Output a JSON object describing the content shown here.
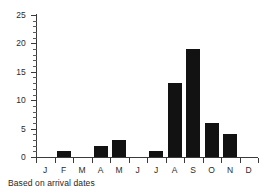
{
  "caption": "Based on arrival dates",
  "chart_data": {
    "type": "bar",
    "title": "",
    "subtitle": "",
    "xlabel": "",
    "ylabel": "",
    "categories": [
      "J",
      "F",
      "M",
      "A",
      "M",
      "J",
      "J",
      "A",
      "S",
      "O",
      "N",
      "D"
    ],
    "values": [
      0,
      1,
      0,
      2,
      3,
      0,
      1,
      13,
      19,
      6,
      4,
      0
    ],
    "ylim": [
      0,
      25
    ],
    "ytick_labels": [
      "0",
      "5",
      "10",
      "15",
      "20",
      "25"
    ],
    "ytick_values": [
      0,
      5,
      10,
      15,
      20,
      25
    ],
    "yminor_step": 1,
    "grid": false,
    "legend": null,
    "bar_color": "#121212",
    "axis_color": "#3a3a3a",
    "annotation": "Based on arrival dates"
  }
}
